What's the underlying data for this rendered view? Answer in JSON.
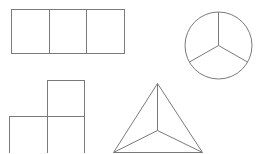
{
  "diagram": {
    "stroke_color": "#7a7a7a",
    "background": "#ffffff",
    "shapes": [
      {
        "id": "three-squares",
        "type": "rectangle-divided",
        "parts": 3
      },
      {
        "id": "circle-thirds",
        "type": "circle-divided",
        "parts": 3
      },
      {
        "id": "l-tromino",
        "type": "squares-l-shape",
        "parts": 3
      },
      {
        "id": "triangle-thirds",
        "type": "triangle-divided",
        "parts": 3
      }
    ]
  }
}
